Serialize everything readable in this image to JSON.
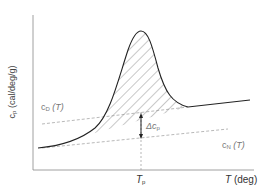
{
  "diagram": {
    "type": "dsc-thermogram",
    "y_axis": {
      "symbol": "c",
      "sub": "p",
      "unit": "(cal/deg/g)"
    },
    "x_axis": {
      "symbol": "T",
      "unit": "(deg)"
    },
    "peak_label": {
      "symbol": "T",
      "sub": "p"
    },
    "baseline_denatured": {
      "symbol": "c",
      "sub": "D",
      "arg": "(T)"
    },
    "baseline_native": {
      "symbol": "c",
      "sub": "N",
      "arg": "(T)"
    },
    "delta_label": {
      "prefix": "Δc",
      "sub": "p"
    },
    "colors": {
      "curve": "#222222",
      "dashed": "#999999",
      "hatch": "#444444",
      "axis": "#888888",
      "text": "#777777"
    }
  }
}
